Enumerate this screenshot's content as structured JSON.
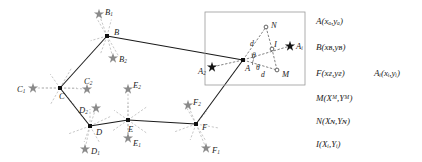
{
  "figure": {
    "type": "geometry-diagram",
    "colors": {
      "solid_edge": "#1a1a1a",
      "dashed_ray": "#b9b9b9",
      "star_marker": "#8a8a8a",
      "vertex_dot": "#111111",
      "inset_border": "#9a9a9a",
      "inset_dashed": "#5a5a5a",
      "background": "#ffffff"
    }
  },
  "polygon": {
    "name": "main-polygon",
    "vertices": [
      {
        "id": "A",
        "label": "A",
        "x": 243,
        "y": 60,
        "label_dx": 2,
        "label_dy": 8
      },
      {
        "id": "B",
        "label": "B",
        "x": 107,
        "y": 36,
        "label_dx": 7,
        "label_dy": -4
      },
      {
        "id": "C",
        "label": "C",
        "x": 60,
        "y": 88,
        "label_dx": -1,
        "label_dy": 8
      },
      {
        "id": "D",
        "label": "D",
        "x": 90,
        "y": 126,
        "label_dx": 6,
        "label_dy": 6
      },
      {
        "id": "E",
        "label": "E",
        "x": 128,
        "y": 120,
        "label_dx": 0,
        "label_dy": 9
      },
      {
        "id": "F",
        "label": "F",
        "x": 196,
        "y": 124,
        "label_dx": 6,
        "label_dy": 3
      }
    ],
    "edges": [
      [
        "B",
        "C"
      ],
      [
        "C",
        "D"
      ],
      [
        "D",
        "E"
      ],
      [
        "E",
        "F"
      ],
      [
        "F",
        "A"
      ],
      [
        "A",
        "B"
      ]
    ]
  },
  "star_markers": [
    {
      "id": "B1",
      "base": "B",
      "sub": "1",
      "x": 99,
      "y": 14,
      "label_dx": 6,
      "label_dy": -1
    },
    {
      "id": "B2",
      "base": "B",
      "sub": "2",
      "x": 113,
      "y": 58,
      "label_dx": 6,
      "label_dy": 2
    },
    {
      "id": "C1",
      "base": "C",
      "sub": "1",
      "x": 33,
      "y": 88,
      "label_dx": -16,
      "label_dy": 2
    },
    {
      "id": "C2",
      "base": "C",
      "sub": "2",
      "x": 87,
      "y": 89,
      "label_dx": -3,
      "label_dy": -7
    },
    {
      "id": "D1",
      "base": "D",
      "sub": "1",
      "x": 85,
      "y": 149,
      "label_dx": 6,
      "label_dy": 3
    },
    {
      "id": "D2",
      "base": "D",
      "sub": "2",
      "x": 96,
      "y": 108,
      "label_dx": -17,
      "label_dy": 3
    },
    {
      "id": "E1",
      "base": "E",
      "sub": "1",
      "x": 128,
      "y": 138,
      "label_dx": 5,
      "label_dy": 6
    },
    {
      "id": "E2",
      "base": "E",
      "sub": "2",
      "x": 128,
      "y": 89,
      "label_dx": 5,
      "label_dy": -3
    },
    {
      "id": "F1",
      "base": "F",
      "sub": "1",
      "x": 206,
      "y": 148,
      "label_dx": 6,
      "label_dy": 3
    },
    {
      "id": "F2",
      "base": "F",
      "sub": "2",
      "x": 188,
      "y": 105,
      "label_dx": 5,
      "label_dy": -2
    }
  ],
  "ray_fans": [
    {
      "vertex": "B",
      "angles_deg": [
        196,
        250,
        300,
        75,
        120
      ]
    },
    {
      "vertex": "C",
      "angles_deg": [
        0,
        180,
        60,
        125,
        240,
        310
      ]
    },
    {
      "vertex": "D",
      "angles_deg": [
        90,
        130,
        200,
        250,
        300,
        25
      ]
    },
    {
      "vertex": "E",
      "angles_deg": [
        90,
        270,
        35,
        145,
        215,
        325
      ]
    },
    {
      "vertex": "F",
      "angles_deg": [
        50,
        120,
        200,
        250,
        300,
        350
      ]
    }
  ],
  "inset": {
    "name": "detail-inset",
    "box": {
      "x": 205,
      "y": 12,
      "w": 100,
      "h": 73
    },
    "points": [
      {
        "id": "A",
        "label": "A",
        "x": 243,
        "y": 60,
        "marker": "dot",
        "label_dx": 2,
        "label_dy": 9
      },
      {
        "id": "N",
        "label": "N",
        "x": 266,
        "y": 27,
        "marker": "circle",
        "label_dx": 5,
        "label_dy": -1
      },
      {
        "id": "M",
        "label": "M",
        "x": 277,
        "y": 70,
        "marker": "circle",
        "label_dx": 5,
        "label_dy": 5
      },
      {
        "id": "I",
        "label": "I",
        "x": 272,
        "y": 49,
        "marker": "circle",
        "label_dx": 2,
        "label_dy": -4
      },
      {
        "id": "Ai",
        "label": "A",
        "sub": "i",
        "x": 290,
        "y": 46,
        "marker": "star",
        "label_dx": 6,
        "label_dy": 1
      },
      {
        "id": "A2",
        "label": "A",
        "sub": "2",
        "x": 212,
        "y": 67,
        "marker": "star",
        "label_dx": -14,
        "label_dy": 5
      }
    ],
    "annotations": [
      {
        "id": "d-upper",
        "text": "d",
        "x": 250,
        "y": 40
      },
      {
        "id": "d-lower",
        "text": "d",
        "x": 261,
        "y": 71
      },
      {
        "id": "theta-upper",
        "text": "θ",
        "x": 252,
        "y": 52
      },
      {
        "id": "theta-lower",
        "text": "θ",
        "x": 256,
        "y": 64
      }
    ],
    "dashed_segments": [
      [
        "A",
        "N"
      ],
      [
        "A",
        "M"
      ],
      [
        "N",
        "I"
      ],
      [
        "M",
        "I"
      ],
      [
        "A",
        "Ai"
      ],
      [
        "A",
        "A2"
      ]
    ]
  },
  "legend": {
    "name": "coordinate-legend",
    "entries": [
      {
        "id": "legend-A",
        "text": "A(xₐ,yₐ)",
        "x": 316,
        "y": 22
      },
      {
        "id": "legend-B",
        "text": "B(xʙ,yʙ)",
        "x": 316,
        "y": 48
      },
      {
        "id": "legend-F",
        "text": "F(xғ,yғ)",
        "x": 316,
        "y": 74
      },
      {
        "id": "legend-Ai",
        "text": "Aᵢ(xᵢ,yᵢ)",
        "x": 374,
        "y": 74
      },
      {
        "id": "legend-M",
        "text": "M(Xᴹ,Yᴹ)",
        "x": 316,
        "y": 99
      },
      {
        "id": "legend-N",
        "text": "N(Xɴ,Yɴ)",
        "x": 316,
        "y": 122
      },
      {
        "id": "legend-I",
        "text": "I(Xᵢ,Yᵢ)",
        "x": 316,
        "y": 145
      }
    ]
  }
}
